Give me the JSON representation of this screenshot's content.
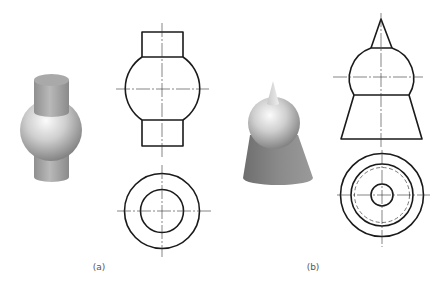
{
  "figure": {
    "background": "#ffffff",
    "line_color": "#1a1a1a",
    "panels": [
      {
        "id": "a",
        "label": "(a)",
        "label_pos": [
          99,
          262
        ],
        "description": "Sphere with cylinders above and below",
        "solid_3d": {
          "top_cylinder": {
            "x1": 34,
            "x2": 69,
            "top_y": 80,
            "bottom_y": 112
          },
          "sphere": {
            "cx": 51,
            "cy": 130,
            "r": 31
          },
          "bottom_cylinder": {
            "x1": 34,
            "x2": 69,
            "top_y": 150,
            "bottom_y": 177
          }
        },
        "front_view": {
          "cx": 162,
          "top_rect": {
            "x1": 142,
            "x2": 183,
            "y1": 32,
            "y2": 57
          },
          "sphere": {
            "cy": 89,
            "r": 38
          },
          "bottom_rect": {
            "x1": 142,
            "x2": 183,
            "y1": 120,
            "y2": 146
          },
          "v_centerline": [
            23,
            157
          ],
          "h_centerline": [
            116,
            209
          ]
        },
        "top_view": {
          "cx": 162,
          "cy": 211,
          "circles": [
            {
              "r": 37.5,
              "style": "solid"
            },
            {
              "r": 21.5,
              "style": "solid"
            }
          ],
          "v_centerline": [
            165,
            257
          ],
          "h_centerline": [
            117,
            212
          ]
        }
      },
      {
        "id": "b",
        "label": "(b)",
        "label_pos": [
          313,
          262
        ],
        "description": "Cone on sphere on truncated cone",
        "solid_3d": {
          "tip": [
            273,
            81
          ],
          "sphere": {
            "cx": 274,
            "cy": 123,
            "r": 26
          },
          "frustum": {
            "top_x1": 250,
            "top_x2": 298,
            "top_y": 135,
            "bottom_x1": 243,
            "bottom_x2": 313,
            "bottom_y": 178
          }
        },
        "front_view": {
          "cx": 381,
          "cone": {
            "tip_y": 19,
            "base_y": 48,
            "x1": 371,
            "x2": 392
          },
          "sphere": {
            "cy": 77,
            "r": 32
          },
          "cut": {
            "y": 95,
            "x1": 354,
            "x2": 409
          },
          "frustum_bottom": {
            "y": 139,
            "x1": 341,
            "x2": 422
          },
          "v_centerline": [
            13,
            148
          ],
          "h_centerline": [
            333,
            423
          ]
        },
        "top_view": {
          "cx": 382,
          "cy": 195,
          "circles": [
            {
              "r": 41.5,
              "style": "solid"
            },
            {
              "r": 31,
              "style": "solid"
            },
            {
              "r": 27.5,
              "style": "dashed"
            },
            {
              "r": 11,
              "style": "solid"
            }
          ],
          "v_centerline": [
            150,
            247
          ],
          "h_centerline": [
            337,
            430
          ]
        }
      }
    ]
  }
}
